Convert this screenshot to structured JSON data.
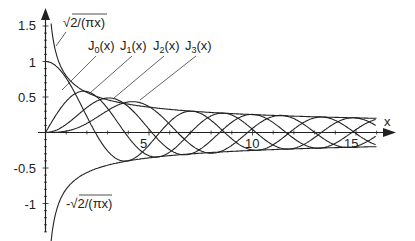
{
  "chart_data": {
    "type": "line",
    "title": "",
    "xlabel": "x",
    "ylabel": "",
    "xlim": [
      0,
      16
    ],
    "ylim": [
      -1.4,
      1.65
    ],
    "grid": false,
    "x_ticks": [
      5,
      10,
      15
    ],
    "x_tick_labels": [
      "5",
      "10",
      "15"
    ],
    "y_ticks": [
      1.5,
      1,
      0.5,
      -0.5,
      -1
    ],
    "y_tick_labels": [
      "1.5",
      "1",
      "0.5",
      "-0.5",
      "-1"
    ],
    "series": [
      {
        "name": "J0(x)",
        "function": "besselJ",
        "order": 0,
        "label_base": "J",
        "label_sub": "0",
        "label_tail": "(x)"
      },
      {
        "name": "J1(x)",
        "function": "besselJ",
        "order": 1,
        "label_base": "J",
        "label_sub": "1",
        "label_tail": "(x)"
      },
      {
        "name": "J2(x)",
        "function": "besselJ",
        "order": 2,
        "label_base": "J",
        "label_sub": "2",
        "label_tail": "(x)"
      },
      {
        "name": "J3(x)",
        "function": "besselJ",
        "order": 3,
        "label_base": "J",
        "label_sub": "3",
        "label_tail": "(x)"
      },
      {
        "name": "√2/(πx)",
        "function": "envelope",
        "sign": 1
      },
      {
        "name": "-√2/(πx)",
        "function": "envelope",
        "sign": -1
      }
    ],
    "annotations": [
      {
        "text_pre": "√",
        "text_over": "2/(πx)",
        "position": "upper-left envelope"
      },
      {
        "text_pre": "-√",
        "text_over": "2/(πx)",
        "position": "lower-left envelope"
      }
    ],
    "colors": {
      "line": "#222222",
      "axis": "#222222",
      "background": "#ffffff"
    }
  }
}
